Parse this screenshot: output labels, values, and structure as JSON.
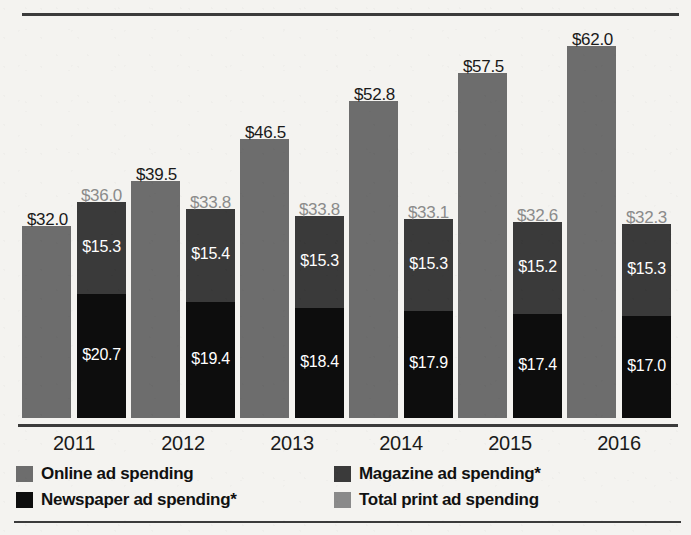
{
  "chart_data": {
    "type": "bar",
    "title": "",
    "xlabel": "",
    "ylabel": "",
    "categories": [
      "2011",
      "2012",
      "2013",
      "2014",
      "2015",
      "2016"
    ],
    "ylim": [
      0,
      66
    ],
    "grid": false,
    "legend_position": "bottom",
    "stacked_series": "Total print ad spending = Magazine ad spending + Newspaper ad spending",
    "series": [
      {
        "name": "Online ad spending",
        "color": "#6d6d6d",
        "values": [
          32.0,
          39.5,
          46.5,
          52.8,
          57.5,
          62.0
        ],
        "labels": [
          "$32.0",
          "$39.5",
          "$46.5",
          "$52.8",
          "$57.5",
          "$62.0"
        ]
      },
      {
        "name": "Magazine ad spending*",
        "color": "#3a3a3a",
        "values": [
          15.3,
          15.4,
          15.3,
          15.3,
          15.2,
          15.3
        ],
        "labels": [
          "$15.3",
          "$15.4",
          "$15.3",
          "$15.3",
          "$15.2",
          "$15.3"
        ]
      },
      {
        "name": "Newspaper ad spending*",
        "color": "#0d0d0d",
        "values": [
          20.7,
          19.4,
          18.4,
          17.9,
          17.4,
          17.0
        ],
        "labels": [
          "$20.7",
          "$19.4",
          "$18.4",
          "$17.9",
          "$17.4",
          "$17.0"
        ]
      },
      {
        "name": "Total print ad spending",
        "color": "#8a8a8a",
        "values": [
          36.0,
          33.8,
          33.8,
          33.1,
          32.6,
          32.3
        ],
        "labels": [
          "$36.0",
          "$33.8",
          "$33.8",
          "$33.1",
          "$32.6",
          "$32.3"
        ]
      }
    ]
  },
  "legend": {
    "items": [
      {
        "label": "Online ad spending",
        "swatch": "online"
      },
      {
        "label": "Magazine ad spending*",
        "swatch": "magazine"
      },
      {
        "label": "Newspaper ad spending*",
        "swatch": "newspaper"
      },
      {
        "label": "Total print ad spending",
        "swatch": "total"
      }
    ]
  },
  "footnote": {
    "text": ""
  }
}
